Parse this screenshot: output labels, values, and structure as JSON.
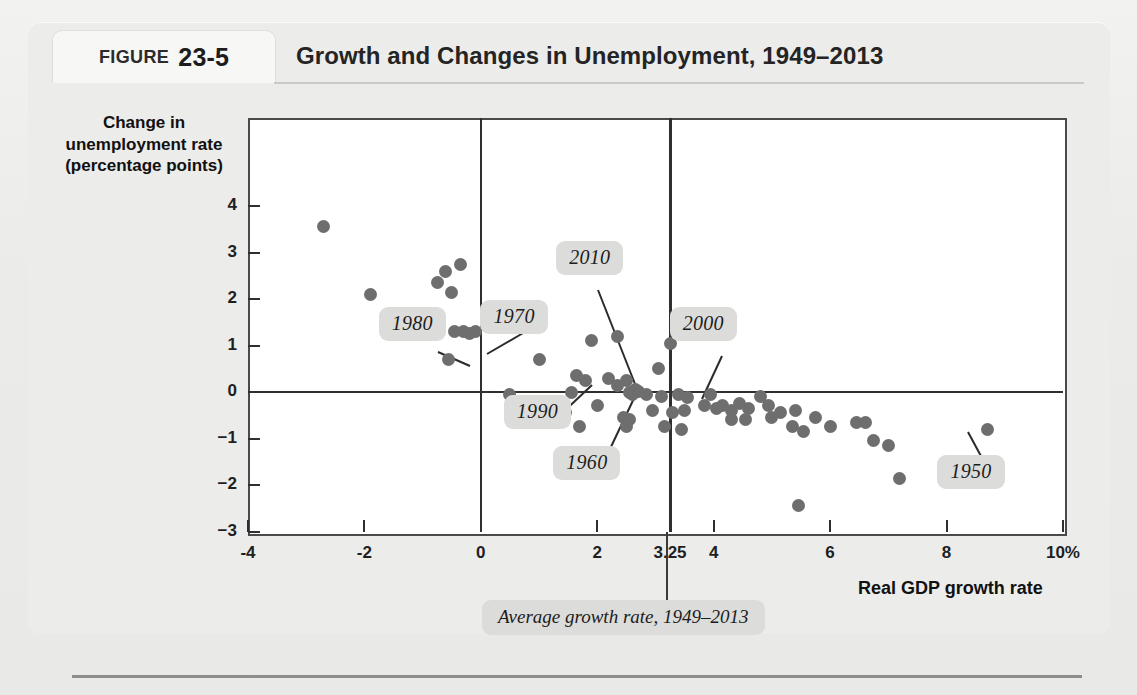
{
  "figure": {
    "label": "FIGURE",
    "number": "23-5",
    "title": "Growth and Changes in Unemployment, 1949–2013"
  },
  "chart_data": {
    "type": "scatter",
    "title": "Growth and Changes in Unemployment, 1949–2013",
    "xlabel": "Real GDP growth rate",
    "ylabel": "Change in unemployment rate (percentage points)",
    "xlim": [
      -4,
      10
    ],
    "ylim": [
      -3,
      4.6
    ],
    "grid": false,
    "legend": "none",
    "xticks": [
      "-4",
      "-2",
      "0",
      "2",
      "3.25",
      "4",
      "6",
      "8",
      "10%"
    ],
    "xtick_values": [
      -4,
      -2,
      0,
      2,
      3.25,
      4,
      6,
      8,
      10
    ],
    "yticks": [
      "4",
      "3",
      "2",
      "1",
      "0",
      "−1",
      "−2",
      "−3"
    ],
    "ytick_values": [
      4,
      3,
      2,
      1,
      0,
      -1,
      -2,
      -3
    ],
    "reference_lines": [
      {
        "name": "zero-unemployment-change",
        "orientation": "horizontal",
        "value": 0
      },
      {
        "name": "zero-growth",
        "orientation": "vertical",
        "value": 0
      },
      {
        "name": "average-growth-rate",
        "orientation": "vertical",
        "value": 3.25
      }
    ],
    "points": [
      [
        -2.7,
        3.55
      ],
      [
        -1.9,
        2.1
      ],
      [
        -0.6,
        2.6
      ],
      [
        -0.35,
        2.75
      ],
      [
        -0.75,
        2.35
      ],
      [
        -0.5,
        2.15
      ],
      [
        -1.25,
        1.3
      ],
      [
        -0.45,
        1.3
      ],
      [
        -0.3,
        1.3
      ],
      [
        -0.2,
        1.25
      ],
      [
        -0.1,
        1.3
      ],
      [
        -0.55,
        0.7
      ],
      [
        0.15,
        1.5
      ],
      [
        1.0,
        0.7
      ],
      [
        1.9,
        1.1
      ],
      [
        2.35,
        1.2
      ],
      [
        1.65,
        0.35
      ],
      [
        1.8,
        0.25
      ],
      [
        2.2,
        0.3
      ],
      [
        2.35,
        0.15
      ],
      [
        2.5,
        0.25
      ],
      [
        2.65,
        0.05
      ],
      [
        2.55,
        0.0
      ],
      [
        2.6,
        -0.05
      ],
      [
        2.7,
        0.02
      ],
      [
        1.55,
        0.0
      ],
      [
        1.45,
        -0.45
      ],
      [
        2.0,
        -0.3
      ],
      [
        2.45,
        -0.55
      ],
      [
        2.5,
        -0.75
      ],
      [
        2.55,
        -0.6
      ],
      [
        1.7,
        -0.75
      ],
      [
        3.1,
        -0.1
      ],
      [
        2.95,
        -0.4
      ],
      [
        3.3,
        -0.45
      ],
      [
        3.5,
        -0.4
      ],
      [
        3.15,
        -0.75
      ],
      [
        3.45,
        -0.8
      ],
      [
        3.05,
        0.5
      ],
      [
        3.25,
        1.05
      ],
      [
        3.4,
        -0.05
      ],
      [
        3.55,
        -0.12
      ],
      [
        3.95,
        -0.05
      ],
      [
        3.85,
        -0.3
      ],
      [
        4.05,
        -0.35
      ],
      [
        4.15,
        -0.3
      ],
      [
        4.3,
        -0.4
      ],
      [
        4.45,
        -0.25
      ],
      [
        4.3,
        -0.6
      ],
      [
        4.55,
        -0.6
      ],
      [
        4.6,
        -0.35
      ],
      [
        4.8,
        -0.1
      ],
      [
        4.95,
        -0.3
      ],
      [
        5.0,
        -0.55
      ],
      [
        5.15,
        -0.45
      ],
      [
        5.4,
        -0.4
      ],
      [
        5.35,
        -0.75
      ],
      [
        5.55,
        -0.85
      ],
      [
        5.75,
        -0.55
      ],
      [
        5.45,
        -2.45
      ],
      [
        6.0,
        -0.75
      ],
      [
        6.45,
        -0.65
      ],
      [
        6.6,
        -0.65
      ],
      [
        6.75,
        -1.05
      ],
      [
        7.0,
        -1.15
      ],
      [
        7.2,
        -1.85
      ],
      [
        8.1,
        -1.85
      ],
      [
        8.7,
        -0.8
      ],
      [
        0.5,
        -0.05
      ],
      [
        2.85,
        -0.05
      ]
    ],
    "annotations": [
      {
        "name": "callout-1980",
        "text": "1980",
        "x": -1.0,
        "y": 1.45
      },
      {
        "name": "callout-1970",
        "text": "1970",
        "x": 0.75,
        "y": 1.6
      },
      {
        "name": "callout-2010",
        "text": "2010",
        "x": 2.05,
        "y": 2.85
      },
      {
        "name": "callout-2000",
        "text": "2000",
        "x": 4.0,
        "y": 1.45
      },
      {
        "name": "callout-1990",
        "text": "1990",
        "x": 1.15,
        "y": -0.45
      },
      {
        "name": "callout-1960",
        "text": "1960",
        "x": 2.0,
        "y": -1.55
      },
      {
        "name": "callout-1950",
        "text": "1950",
        "x": 8.6,
        "y": -1.75
      },
      {
        "name": "average-growth-note",
        "text": "Average growth rate, 1949–2013",
        "x": 3.25,
        "y": -4.2
      }
    ]
  },
  "colors": {
    "dot": "#6e6e6e",
    "axis": "#2f2f2f",
    "callout_bg": "#dcdcda",
    "panel_bg": "#ececeb",
    "plot_bg": "#ffffff"
  }
}
